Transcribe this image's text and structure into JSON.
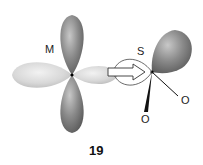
{
  "diagram": {
    "metal_label": "M",
    "sulfur_label": "S",
    "oxygen_labels": [
      "O",
      "O"
    ],
    "figure_number": "19",
    "colors": {
      "dark_lobe": "#7a7a7a",
      "light_lobe": "#d4d4d4",
      "background": "#ffffff"
    }
  }
}
